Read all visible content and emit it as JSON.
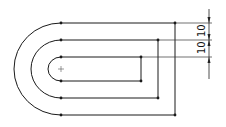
{
  "sketch": {
    "colors": {
      "line": "#1a1a1a",
      "dimension": "#222222",
      "background": "#ffffff"
    },
    "center_mark": "+",
    "profiles": [
      {
        "name": "outer-slot",
        "top_y": 23,
        "bottom_y": 115,
        "left_x": 61,
        "right_x": 175
      },
      {
        "name": "middle-slot",
        "top_y": 40,
        "bottom_y": 98,
        "left_x": 61,
        "right_x": 158
      },
      {
        "name": "inner-slot",
        "top_y": 57,
        "bottom_y": 81,
        "left_x": 61,
        "right_x": 141
      }
    ],
    "dimensions": [
      {
        "label": "10",
        "between": "outer-top and middle-top"
      },
      {
        "label": "10",
        "between": "middle-top and inner-top"
      }
    ]
  }
}
